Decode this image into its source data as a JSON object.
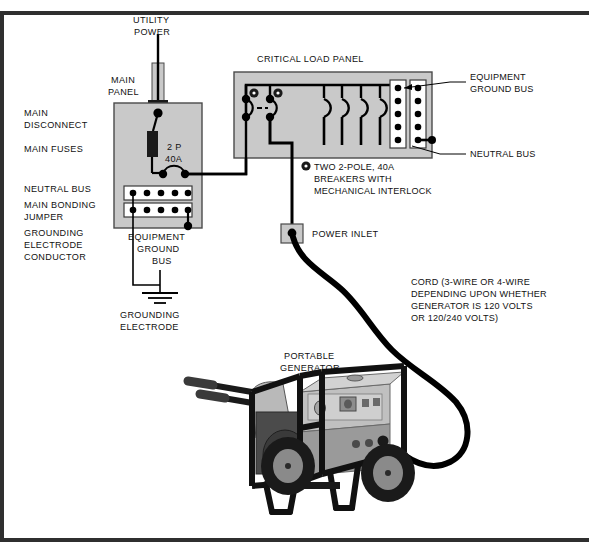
{
  "diagram": {
    "border_color": "#2b2b2b",
    "panel_fill": "#c9c9c9",
    "panel_stroke": "#4a4a4a",
    "wire_color": "#000000",
    "bus_fill": "#ffffff"
  },
  "labels": {
    "utility_power_l1": "UTILITY",
    "utility_power_l2": "POWER",
    "main_panel_l1": "MAIN",
    "main_panel_l2": "PANEL",
    "main_disconnect_l1": "MAIN",
    "main_disconnect_l2": "DISCONNECT",
    "main_fuses": "MAIN  FUSES",
    "neutral_bus_left": "NEUTRAL  BUS",
    "main_bonding_l1": "MAIN  BONDING",
    "main_bonding_l2": "JUMPER",
    "grounding_conductor_l1": "GROUNDING",
    "grounding_conductor_l2": "ELECTRODE",
    "grounding_conductor_l3": "CONDUCTOR",
    "equipment_ground_bus_left_l1": "EQUIPMENT",
    "equipment_ground_bus_left_l2": "GROUND",
    "equipment_ground_bus_left_l3": "BUS",
    "grounding_electrode_l1": "GROUNDING",
    "grounding_electrode_l2": "ELECTRODE",
    "breaker_rating_l1": "2 P",
    "breaker_rating_l2": "40A",
    "critical_load_panel": "CRITICAL  LOAD  PANEL",
    "equipment_ground_bus_right_l1": "EQUIPMENT",
    "equipment_ground_bus_right_l2": "GROUND BUS",
    "neutral_bus_right": "NEUTRAL BUS",
    "interlock_note_l1": "TWO 2-POLE, 40A",
    "interlock_note_l2": "BREAKERS WITH",
    "interlock_note_l3": "MECHANICAL INTERLOCK",
    "power_inlet": "POWER  INLET",
    "cord_note_l1": "CORD (3-WIRE OR 4-WIRE",
    "cord_note_l2": "DEPENDING UPON WHETHER",
    "cord_note_l3": "GENERATOR IS 120 VOLTS",
    "cord_note_l4": "OR 120/240 VOLTS)",
    "portable_generator_l1": "PORTABLE",
    "portable_generator_l2": "GENERATOR"
  },
  "components": {
    "main_panel": {
      "breaker": "2 P 40A",
      "neutral_bus_dots": 5,
      "ground_bus_dots": 5
    },
    "critical_load_panel": {
      "interlocked_breakers": 2,
      "branch_breakers": 4,
      "equipment_ground_bus_dots": 5,
      "neutral_bus_dots": 5
    },
    "generator": {
      "wheels": 2,
      "handles": 2,
      "outlet_panel_controls": 5
    }
  }
}
